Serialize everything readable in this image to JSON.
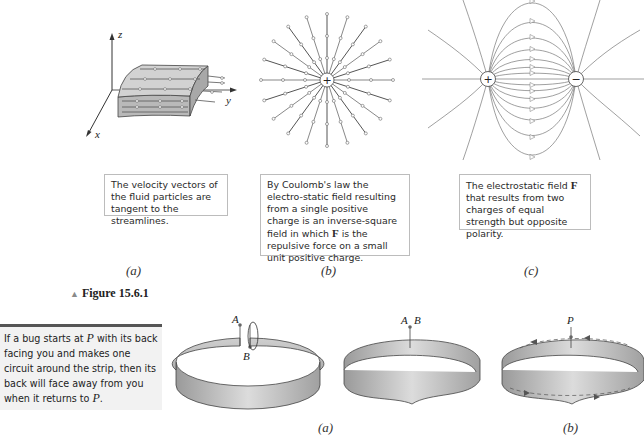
{
  "figure_top": {
    "label": "Figure 15.6.1",
    "panels": [
      {
        "id": "a",
        "sublabel": "(a)",
        "caption": "The velocity vectors of the fluid particles are tangent to the streamlines.",
        "axes": {
          "x": "x",
          "y": "y",
          "z": "z"
        },
        "icon": "fluid-slab-streamlines"
      },
      {
        "id": "b",
        "sublabel": "(b)",
        "caption_parts": [
          "By Coulomb's law the electro-static field resulting from a single positive charge is an inverse-square field in which ",
          "F",
          " is the repulsive force on a small unit positive charge."
        ],
        "charge": "+",
        "icon": "radial-field-lines"
      },
      {
        "id": "c",
        "sublabel": "(c)",
        "caption_parts": [
          "The electrostatic field ",
          "F",
          " that results from two charges of equal strength but opposite polarity."
        ],
        "charges": [
          "+",
          "−"
        ],
        "icon": "dipole-field-lines"
      }
    ]
  },
  "sidenote": {
    "parts": [
      "If a bug starts at ",
      "P",
      " with its back facing you and makes one circuit around the strip, then its back will face away from you when it returns to ",
      "P",
      "."
    ]
  },
  "figure_bottom": {
    "panels": [
      {
        "id": "a",
        "sublabel": "(a)",
        "points": [
          "A",
          "B"
        ],
        "icon": "cut-band-and-mobius-strip"
      },
      {
        "id": "b",
        "sublabel": "(b)",
        "points": [
          "P"
        ],
        "icon": "mobius-strip-path"
      }
    ]
  }
}
